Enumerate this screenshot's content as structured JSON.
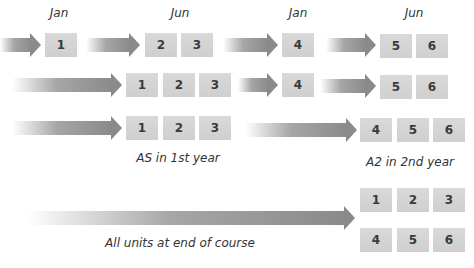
{
  "colors": {
    "box_fill": "#d4d4d4",
    "box_text": "#3a3a3a",
    "arrow": "#8a8a8a",
    "label_text": "#333333",
    "background": "#ffffff"
  },
  "month_labels": [
    "Jan",
    "Jun",
    "Jan",
    "Jun"
  ],
  "rows": [
    {
      "name": "row-1-modular",
      "groups": [
        {
          "units": [
            "1"
          ]
        },
        {
          "units": [
            "2",
            "3"
          ]
        },
        {
          "units": [
            "4"
          ]
        },
        {
          "units": [
            "5",
            "6"
          ]
        }
      ]
    },
    {
      "name": "row-2",
      "groups": [
        {
          "units": [
            "1",
            "2",
            "3"
          ]
        },
        {
          "units": [
            "4"
          ]
        },
        {
          "units": [
            "5",
            "6"
          ]
        }
      ]
    },
    {
      "name": "row-3-as-a2",
      "groups": [
        {
          "units": [
            "1",
            "2",
            "3"
          ]
        },
        {
          "units": [
            "4",
            "5",
            "6"
          ]
        }
      ]
    },
    {
      "name": "row-4-linear",
      "groups": [
        {
          "units": [
            "1",
            "2",
            "3",
            "4",
            "5",
            "6"
          ]
        }
      ]
    }
  ],
  "captions": {
    "as_first_year": "AS in 1st year",
    "a2_second_year": "A2 in 2nd year",
    "all_units_end": "All units at end of course"
  }
}
